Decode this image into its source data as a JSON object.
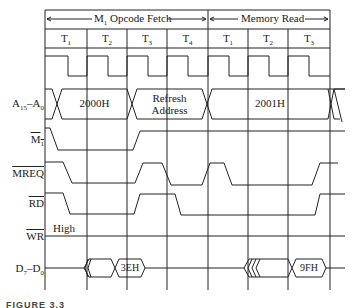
{
  "diagram": {
    "type": "timing-diagram",
    "phases": [
      {
        "label": "M",
        "sub": "1",
        "suffix": " Opcode Fetch",
        "states": [
          "T1",
          "T2",
          "T3",
          "T4"
        ]
      },
      {
        "label": "Memory Read",
        "states": [
          "T1",
          "T2",
          "T3"
        ]
      }
    ],
    "state_labels": [
      {
        "t": "T",
        "s": "1"
      },
      {
        "t": "T",
        "s": "2"
      },
      {
        "t": "T",
        "s": "3"
      },
      {
        "t": "T",
        "s": "4"
      },
      {
        "t": "T",
        "s": "1"
      },
      {
        "t": "T",
        "s": "2"
      },
      {
        "t": "T",
        "s": "3"
      }
    ],
    "signals": {
      "address": {
        "name": "A",
        "sub1": "15",
        "mid": "–A",
        "sub2": "0"
      },
      "m1": {
        "name": "M",
        "sub": "1",
        "active_low": true
      },
      "mreq": {
        "name": "MREQ",
        "active_low": true
      },
      "rd": {
        "name": "RD",
        "active_low": true
      },
      "wr": {
        "name": "WR",
        "active_low": true,
        "note": "High"
      },
      "data": {
        "name": "D",
        "sub1": "7",
        "mid": "–D",
        "sub2": "0"
      }
    },
    "values": {
      "addr1": "2000H",
      "addr_refresh_line1": "Refresh",
      "addr_refresh_line2": "Address",
      "addr2": "2001H",
      "data1": "3EH",
      "data2": "9FH"
    },
    "caption": "FIGURE 3.3"
  }
}
